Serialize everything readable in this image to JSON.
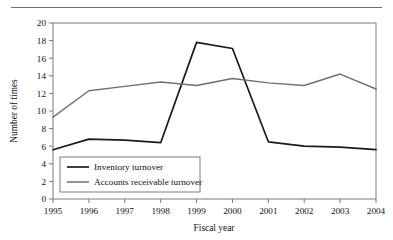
{
  "figure": {
    "has_top_rule": true,
    "background": "#ffffff",
    "frame_color": "#7a7a7a"
  },
  "chart_data": {
    "type": "line",
    "title": "",
    "subtitle": "",
    "xlabel": "Fiscal year",
    "ylabel": "Number of times",
    "categories": [
      "1995",
      "1996",
      "1997",
      "1998",
      "1999",
      "2000",
      "2001",
      "2002",
      "2003",
      "2004"
    ],
    "x": [
      1995,
      1996,
      1997,
      1998,
      1999,
      2000,
      2001,
      2002,
      2003,
      2004
    ],
    "series": [
      {
        "name": "Inventory turnover",
        "color": "#1a1a1a",
        "line_width": 1.7,
        "values": [
          5.6,
          6.8,
          6.7,
          6.4,
          17.8,
          17.1,
          6.5,
          6.0,
          5.9,
          5.6
        ]
      },
      {
        "name": "Accounts receivable turnover",
        "color": "#707070",
        "line_width": 1.4,
        "values": [
          9.3,
          12.3,
          12.8,
          13.3,
          12.9,
          13.7,
          13.2,
          12.9,
          14.2,
          12.5
        ]
      }
    ],
    "ylim": [
      0,
      20
    ],
    "yticks": [
      0,
      2,
      4,
      6,
      8,
      10,
      12,
      14,
      16,
      18,
      20
    ],
    "ytick_labels": [
      "0",
      "2",
      "4",
      "6",
      "8",
      "10",
      "12",
      "14",
      "16",
      "18",
      "20"
    ],
    "xtick_labels": [
      "1995",
      "1996",
      "1997",
      "1998",
      "1999",
      "2000",
      "2001",
      "2002",
      "2003",
      "2004"
    ],
    "grid": false,
    "legend_position": "lower left",
    "legend_entries": [
      "Inventory turnover",
      "Accounts receivable turnover"
    ]
  }
}
